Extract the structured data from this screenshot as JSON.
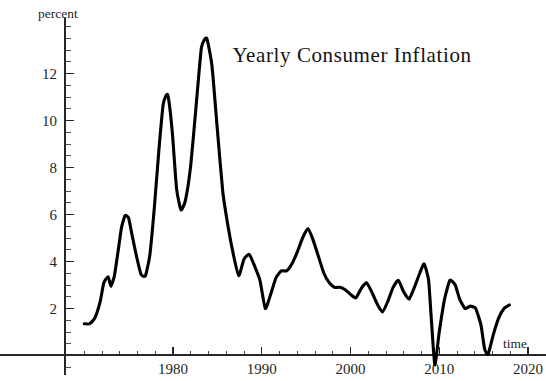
{
  "chart_data": {
    "type": "line",
    "title": "Yearly Consumer Inflation",
    "xlabel": "time",
    "ylabel": "percent",
    "grid": false,
    "legend": "none",
    "xlim": [
      1970,
      2020
    ],
    "ylim": [
      -0.6,
      14.2
    ],
    "x_ticks_major": [
      1980,
      1990,
      2000,
      2010,
      2020
    ],
    "x_tick_labels": [
      "1980",
      "1990",
      "2000",
      "2010",
      "2020"
    ],
    "x_tick_minor_step": 2,
    "y_ticks_major": [
      2,
      4,
      6,
      8,
      10,
      12
    ],
    "y_tick_labels": [
      "2",
      "4",
      "6",
      "8",
      "10",
      "12"
    ],
    "y_tick_minor_step": 0.5,
    "series": [
      {
        "name": "Yearly Consumer Inflation",
        "color": "#000000",
        "x": [
          1970.0,
          1970.6,
          1971.2,
          1971.8,
          1972.2,
          1972.7,
          1973.0,
          1973.4,
          1973.8,
          1974.2,
          1974.6,
          1975.0,
          1975.4,
          1975.9,
          1976.4,
          1976.9,
          1977.4,
          1977.9,
          1978.4,
          1978.9,
          1979.4,
          1979.9,
          1980.4,
          1980.9,
          1981.4,
          1982.0,
          1982.6,
          1983.2,
          1983.8,
          1984.4,
          1985.0,
          1985.6,
          1986.2,
          1986.8,
          1987.4,
          1988.0,
          1988.6,
          1989.2,
          1989.8,
          1990.4,
          1991.0,
          1991.6,
          1992.2,
          1992.8,
          1993.4,
          1994.0,
          1994.6,
          1995.2,
          1995.8,
          1996.4,
          1997.0,
          1997.6,
          1998.2,
          1998.8,
          1999.4,
          2000.0,
          2000.6,
          2001.2,
          2001.8,
          2002.4,
          2003.0,
          2003.6,
          2004.2,
          2004.8,
          2005.4,
          2006.0,
          2006.6,
          2007.2,
          2007.8,
          2008.3,
          2008.8,
          2009.1,
          2009.5,
          2010.0,
          2010.6,
          2011.2,
          2011.8,
          2012.3,
          2012.9,
          2013.5,
          2014.1,
          2014.7,
          2015.1,
          2015.5,
          2016.1,
          2016.7,
          2017.3,
          2017.9
        ],
        "y": [
          1.35,
          1.35,
          1.6,
          2.3,
          3.1,
          3.35,
          2.95,
          3.4,
          4.4,
          5.45,
          5.95,
          5.85,
          5.1,
          4.2,
          3.45,
          3.4,
          4.3,
          6.3,
          8.7,
          10.7,
          11.1,
          9.6,
          7.1,
          6.2,
          6.6,
          8.1,
          10.6,
          13.1,
          13.5,
          12.3,
          9.6,
          7.0,
          5.5,
          4.3,
          3.4,
          4.1,
          4.3,
          3.8,
          3.2,
          2.0,
          2.6,
          3.3,
          3.6,
          3.6,
          3.9,
          4.4,
          5.0,
          5.4,
          4.9,
          4.2,
          3.5,
          3.1,
          2.9,
          2.9,
          2.8,
          2.6,
          2.45,
          2.85,
          3.1,
          2.7,
          2.2,
          1.85,
          2.3,
          2.9,
          3.2,
          2.7,
          2.4,
          2.9,
          3.5,
          3.9,
          3.2,
          1.6,
          -0.4,
          1.0,
          2.4,
          3.2,
          3.0,
          2.4,
          2.0,
          2.1,
          2.0,
          1.3,
          0.3,
          0.05,
          0.9,
          1.6,
          2.0,
          2.15
        ]
      }
    ],
    "annotations": []
  },
  "figure": {
    "title": "Yearly Consumer Inflation",
    "y_axis_caption": "percent",
    "x_axis_caption": "time"
  }
}
